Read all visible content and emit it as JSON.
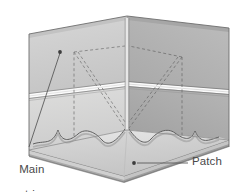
{
  "figure": {
    "type": "technical-isometric-diagram",
    "background_color": "#ffffff"
  },
  "labels": {
    "main_strip": {
      "line1": "Main",
      "line2": "strip",
      "color": "#4a4a4a",
      "leader_dot": [
        60,
        52
      ],
      "leader_end": [
        29,
        147
      ]
    },
    "patch": {
      "text": "Patch",
      "color": "#4a4a4a",
      "leader_dot": [
        134,
        163
      ],
      "leader_end": [
        188,
        163
      ]
    }
  },
  "palette": {
    "wall_left_upper": "#cfcfcf",
    "wall_left_lower": "#d9d9d9",
    "wall_right_upper": "#b4b4b4",
    "wall_right_lower": "#adadad",
    "wall_left_top_band": "#c6c6c6",
    "wall_right_top_band": "#a8a8a8",
    "strip_highlight": "#fbfbfb",
    "strip_shadow": "#8f8f8f",
    "floor_top": "#e0e0e0",
    "floor_patch": "#d2d2d2",
    "floor_edge": "#bdbdbd",
    "floor_side": "#9b9b9b",
    "outline": "#6e6e6e",
    "dashed": "#7a7a7a",
    "leader": "#5a5a5a"
  },
  "geometry": {
    "corner_apex_top": [
      127,
      18
    ],
    "corner_apex_bottom": [
      127,
      128
    ],
    "left_wall_outer_top": [
      29,
      36
    ],
    "right_wall_outer_top": [
      229,
      28
    ],
    "floor_front_apex": [
      124,
      176
    ],
    "dashed_v_count": 2,
    "scallop_count": 4
  }
}
